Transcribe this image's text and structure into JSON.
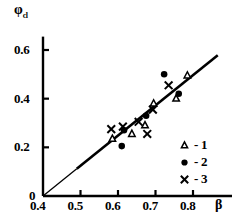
{
  "chart_data": {
    "type": "scatter",
    "title": "",
    "subtitle": "",
    "xlabel": "β",
    "ylabel": "φ",
    "ylabel_subscript": "cl",
    "xlim": [
      0.4,
      0.82
    ],
    "ylim": [
      0.0,
      0.66
    ],
    "xticks": [
      0.4,
      0.5,
      0.6,
      0.7,
      0.8
    ],
    "xtick_labels": [
      "0.4",
      "0.5",
      "0.6",
      "0.7",
      "0.8"
    ],
    "yticks": [
      0.0,
      0.2,
      0.4,
      0.6
    ],
    "ytick_labels": [
      "0",
      "0.2",
      "0.4",
      "0.6"
    ],
    "grid": false,
    "legend_position": "lower-right",
    "series": [
      {
        "name": "1",
        "marker": "open-triangle",
        "color": "#000000",
        "points": [
          {
            "x": 0.585,
            "y": 0.235
          },
          {
            "x": 0.637,
            "y": 0.255
          },
          {
            "x": 0.672,
            "y": 0.29
          },
          {
            "x": 0.695,
            "y": 0.38
          },
          {
            "x": 0.755,
            "y": 0.4
          },
          {
            "x": 0.785,
            "y": 0.495
          }
        ]
      },
      {
        "name": "2",
        "marker": "filled-circle",
        "color": "#000000",
        "points": [
          {
            "x": 0.61,
            "y": 0.205
          },
          {
            "x": 0.616,
            "y": 0.27
          },
          {
            "x": 0.675,
            "y": 0.33
          },
          {
            "x": 0.723,
            "y": 0.5
          },
          {
            "x": 0.762,
            "y": 0.42
          }
        ]
      },
      {
        "name": "3",
        "marker": "cross",
        "color": "#000000",
        "points": [
          {
            "x": 0.582,
            "y": 0.275
          },
          {
            "x": 0.613,
            "y": 0.285
          },
          {
            "x": 0.655,
            "y": 0.305
          },
          {
            "x": 0.678,
            "y": 0.255
          },
          {
            "x": 0.693,
            "y": 0.355
          },
          {
            "x": 0.735,
            "y": 0.455
          }
        ]
      }
    ],
    "reference_line": {
      "name": "diagonal-fit-line",
      "from": {
        "x": 0.4,
        "y": 0.0
      },
      "to": {
        "x": 0.866,
        "y": 0.578
      },
      "thin_until": {
        "x": 0.49,
        "y": 0.112
      },
      "color": "#000000"
    },
    "legend": [
      {
        "symbol": "open-triangle",
        "label": "- 1"
      },
      {
        "symbol": "filled-circle",
        "label": "- 2"
      },
      {
        "symbol": "cross",
        "label": "- 3"
      }
    ]
  }
}
